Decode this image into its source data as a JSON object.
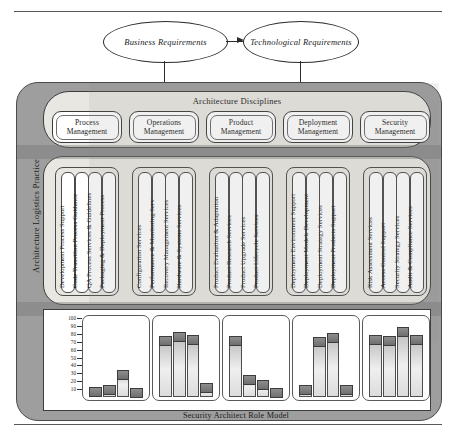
{
  "figure": {
    "outer_label": "Architecture Logistics Practice",
    "disciplines_title": "Architecture Disciplines",
    "solution_activities_label": "Solution Activities",
    "role_model_caption": "Security Architect Role Model"
  },
  "requirements": {
    "business": "Business Requirements",
    "technological": "Technological Requirements"
  },
  "disciplines": [
    {
      "title": "Process\nManagement",
      "activities": [
        "Development Process Support",
        "Code Transition Process Guidance",
        "QA Process Services & Guidelines",
        "Packaging & Deployment Process"
      ]
    },
    {
      "title": "Operations\nManagement",
      "activities": [
        "Configuration Services",
        "Performance & Monitoring Serv",
        "Recovery Management Services",
        "Hardware & Systems Services"
      ]
    },
    {
      "title": "Product\nManagement",
      "activities": [
        "Product Evaluation & Adaptation",
        "Product Research Services",
        "Product Upgrade Services",
        "Product Lifecycle Services"
      ]
    },
    {
      "title": "Deployment\nManagement",
      "activities": [
        "Deployment Environment Support",
        "Deployment Models Development",
        "Deployment Strategy Services",
        "Deployment Products Support"
      ]
    },
    {
      "title": "Security\nManagement",
      "activities": [
        "Risk Assessment Services",
        "Access Control Support",
        "Security Strategy Services",
        "Audit & Compliance Services"
      ]
    }
  ],
  "chart_data": {
    "type": "bar",
    "title": "Security Architect Role Model",
    "xlabel": "",
    "ylabel": "",
    "ylim": [
      0,
      100
    ],
    "yticks": [
      100,
      90,
      80,
      70,
      60,
      50,
      40,
      30,
      20,
      10
    ],
    "grid": false,
    "legend": "none",
    "groups": [
      {
        "name": "Process Management",
        "categories": [
          "Development Process Support",
          "Code Transition Process Guidance",
          "QA Process Services & Guidelines",
          "Packaging & Deployment Process"
        ],
        "values": [
          13,
          15,
          35,
          12
        ]
      },
      {
        "name": "Operations Management",
        "categories": [
          "Configuration Services",
          "Performance & Monitoring Serv",
          "Recovery Management Services",
          "Hardware & Systems Services"
        ],
        "values": [
          78,
          83,
          80,
          18
        ]
      },
      {
        "name": "Product Management",
        "categories": [
          "Product Evaluation & Adaptation",
          "Product Research Services",
          "Product Upgrade Services",
          "Product Lifecycle Services"
        ],
        "values": [
          78,
          28,
          22,
          12
        ]
      },
      {
        "name": "Deployment Management",
        "categories": [
          "Deployment Environment Support",
          "Deployment Models Development",
          "Deployment Strategy Services",
          "Deployment Products Support"
        ],
        "values": [
          15,
          77,
          82,
          15
        ]
      },
      {
        "name": "Security Management",
        "categories": [
          "Risk Assessment Services",
          "Access Control Support",
          "Security Strategy Services",
          "Audit & Compliance Services"
        ],
        "values": [
          80,
          78,
          90,
          80
        ]
      }
    ]
  },
  "colors": {
    "shell": "#9e9e9e",
    "band": "#e9e7e2",
    "outline": "#3d3d3d",
    "bar_body": "#e6e6e6",
    "bar_cap": "#7d7d7d"
  }
}
